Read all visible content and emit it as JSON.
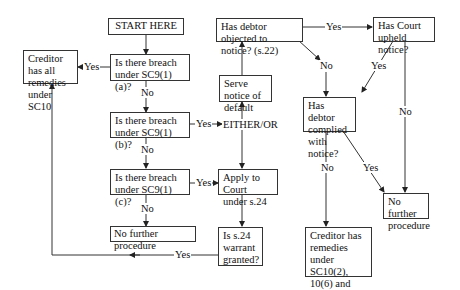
{
  "nodes": {
    "start": "START HERE",
    "q_a": "Is there breach under SC9(1)(a)?",
    "q_b": "Is there breach under SC9(1)(b)?",
    "q_c": "Is there breach under SC9(1)(c)?",
    "no_further_1": "No further procedure",
    "creditor_all": "Creditor has all remedies under SC10",
    "serve_notice": "Serve notice of default",
    "either_or": "EITHER/OR",
    "apply_court": "Apply to Court under s.24",
    "s24_granted": "Is s.24 warrant granted?",
    "debtor_objected": "Has debtor objected to notice? (s.22)",
    "court_upheld": "Has Court upheld notice?",
    "debtor_complied": "Has debtor complied with notice?",
    "no_further_2": "No further procedure",
    "creditor_remedies": "Creditor has remedies under SC10(2), 10(6) and 10(7)"
  },
  "labels": {
    "yes": "Yes",
    "no": "No"
  }
}
